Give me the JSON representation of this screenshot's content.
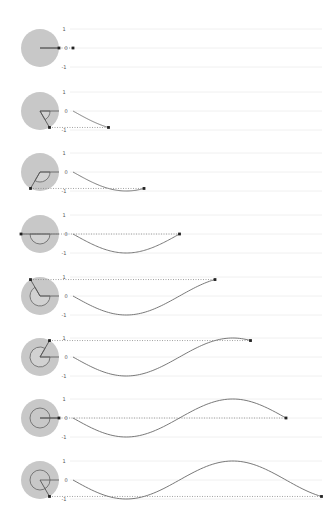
{
  "diagram": {
    "title": "",
    "type": "unit-circle-to-sine-wave",
    "colors": {
      "background": "#ffffff",
      "disk": "#c8c8c8",
      "arc": "#6e6e6e",
      "radius": "#555555",
      "curve": "#6a6a6a",
      "gridline": "#ececec",
      "guide": "#8a8a8a",
      "dot": "#222222",
      "label": "#555555"
    },
    "axis_labels": {
      "top": "1",
      "middle": "0",
      "bottom": "-1"
    },
    "layout": {
      "circle_cx": 40,
      "circle_r": 19,
      "arc_r": 10,
      "plot_x0": 73,
      "grid_x0": 70,
      "grid_x1": 322,
      "label_x": 64,
      "amplitude_px": 19,
      "px_per_radian": 33.9
    },
    "panels": [
      {
        "angle_deg": 0,
        "center_y": 48
      },
      {
        "angle_deg": 60,
        "center_y": 111
      },
      {
        "angle_deg": 120,
        "center_y": 172
      },
      {
        "angle_deg": 180,
        "center_y": 234
      },
      {
        "angle_deg": 240,
        "center_y": 296
      },
      {
        "angle_deg": 300,
        "center_y": 357
      },
      {
        "angle_deg": 360,
        "center_y": 418
      },
      {
        "angle_deg": 420,
        "center_y": 480
      }
    ]
  }
}
